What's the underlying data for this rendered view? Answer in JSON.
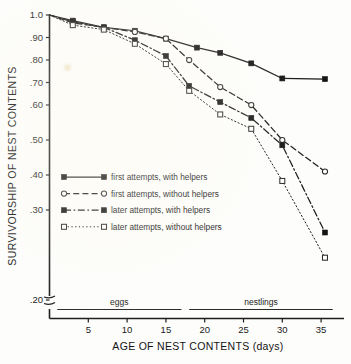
{
  "chart_data": {
    "type": "line",
    "title": "",
    "xlabel": "AGE OF NEST CONTENTS (days)",
    "ylabel": "SURVIVORSHIP OF NEST CONTENTS",
    "xlim": [
      0,
      37
    ],
    "ylim": [
      0.2,
      1.0
    ],
    "xticks": [
      5,
      10,
      15,
      20,
      25,
      30,
      35
    ],
    "xtick_labels": [
      "5",
      "10",
      "15",
      "20",
      "25",
      "30",
      "35"
    ],
    "yticks": [
      1.0,
      0.9,
      0.8,
      0.7,
      0.6,
      0.5,
      0.4,
      0.3,
      0.2
    ],
    "ytick_labels": [
      "1.0",
      ".90",
      ".80",
      ".70",
      ".60",
      ".50",
      ".40",
      ".30",
      ".20"
    ],
    "y_axis_break": true,
    "grid": false,
    "legend_position": "center-left",
    "phase_bands": [
      {
        "label": "eggs",
        "x_start": 1,
        "x_end": 17
      },
      {
        "label": "nestlings",
        "x_end": 36.5,
        "x_start": 18
      }
    ],
    "series": [
      {
        "name": "first attempts, with helpers",
        "marker": "filled-square",
        "linestyle": "solid",
        "x": [
          0,
          3,
          7,
          11,
          15,
          19,
          22,
          26,
          30,
          35.5
        ],
        "y": [
          1.0,
          0.975,
          0.945,
          0.93,
          0.895,
          0.855,
          0.832,
          0.785,
          0.718,
          0.715
        ]
      },
      {
        "name": "first attempts, without helpers",
        "marker": "open-circle",
        "linestyle": "dashed",
        "x": [
          0,
          3,
          7,
          11,
          15,
          18,
          22,
          26,
          30,
          35.5
        ],
        "y": [
          1.0,
          0.965,
          0.945,
          0.925,
          0.895,
          0.8,
          0.68,
          0.6,
          0.5,
          0.41
        ]
      },
      {
        "name": "later attempts, with helpers",
        "marker": "filled-square",
        "linestyle": "dashdot",
        "x": [
          0,
          3,
          7,
          11,
          15,
          18,
          22,
          26,
          30,
          35.5
        ],
        "y": [
          1.0,
          0.97,
          0.945,
          0.888,
          0.818,
          0.685,
          0.613,
          0.563,
          0.485,
          0.275
        ]
      },
      {
        "name": "later attempts, without helpers",
        "marker": "open-square",
        "linestyle": "dotted",
        "x": [
          0,
          3,
          7,
          11,
          15,
          18,
          22,
          26,
          30,
          35.5
        ],
        "y": [
          1.0,
          0.955,
          0.935,
          0.872,
          0.782,
          0.663,
          0.573,
          0.532,
          0.383,
          0.247
        ]
      }
    ],
    "legend_entries": [
      {
        "label": "first attempts, with helpers",
        "marker": "filled-square",
        "linestyle": "solid"
      },
      {
        "label": "first attempts, without helpers",
        "marker": "open-circle",
        "linestyle": "dashed"
      },
      {
        "label": "later attempts, with helpers",
        "marker": "filled-square",
        "linestyle": "dashdot"
      },
      {
        "label": "later attempts, without helpers",
        "marker": "open-square",
        "linestyle": "dotted"
      }
    ],
    "colors": {
      "ink": "#1a1a1a",
      "background": "#fdfdfc"
    }
  },
  "axis": {
    "y_title": "SURVIVORSHIP OF NEST CONTENTS",
    "x_title": "AGE OF NEST CONTENTS (days)",
    "y_ticks": [
      {
        "label": "1.0",
        "value": 1.0
      },
      {
        "label": ".90",
        "value": 0.9
      },
      {
        "label": ".80",
        "value": 0.8
      },
      {
        "label": ".70",
        "value": 0.7
      },
      {
        "label": ".60",
        "value": 0.6
      },
      {
        "label": ".50",
        "value": 0.5
      },
      {
        "label": ".40",
        "value": 0.4
      },
      {
        "label": ".30",
        "value": 0.3
      },
      {
        "label": ".20",
        "value": 0.2
      }
    ],
    "x_ticks": [
      {
        "label": "5",
        "value": 5
      },
      {
        "label": "10",
        "value": 10
      },
      {
        "label": "15",
        "value": 15
      },
      {
        "label": "20",
        "value": 20
      },
      {
        "label": "25",
        "value": 25
      },
      {
        "label": "30",
        "value": 30
      },
      {
        "label": "35",
        "value": 35
      }
    ]
  },
  "phases": {
    "eggs": "eggs",
    "nestlings": "nestlings"
  },
  "legend": {
    "items": [
      "first attempts, with helpers",
      "first attempts, without helpers",
      "later attempts, with helpers",
      "later attempts, without helpers"
    ]
  }
}
